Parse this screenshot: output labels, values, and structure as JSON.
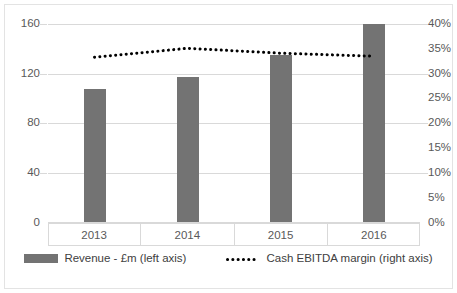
{
  "chart_data": {
    "type": "bar",
    "title": "",
    "subtitle": "",
    "xlabel": "",
    "ylabel": "",
    "categories": [
      "2013",
      "2014",
      "2015",
      "2016"
    ],
    "grid": true,
    "legend_position": "bottom",
    "axes": {
      "left": {
        "label": "Revenue - £m",
        "ylim": [
          0,
          160
        ],
        "ticks": [
          0,
          40,
          80,
          120,
          160
        ],
        "tick_labels": [
          "0",
          "40",
          "80",
          "120",
          "160"
        ]
      },
      "right": {
        "label": "Cash EBITDA margin",
        "ylim": [
          0,
          0.4
        ],
        "ticks": [
          0,
          5,
          10,
          15,
          20,
          25,
          30,
          35,
          40
        ],
        "tick_labels": [
          "0%",
          "5%",
          "10%",
          "15%",
          "20%",
          "25%",
          "30%",
          "35%",
          "40%"
        ]
      }
    },
    "series": [
      {
        "name": "Revenue - £m (left axis)",
        "type": "bar",
        "axis": "left",
        "color": "#737373",
        "values": [
          107.5,
          117,
          135,
          160
        ]
      },
      {
        "name": "Cash EBITDA margin (right axis)",
        "type": "line",
        "style": "dotted",
        "axis": "right",
        "color": "#000000",
        "values": [
          33.3,
          35.1,
          34.1,
          33.5
        ]
      }
    ]
  },
  "legend": {
    "items": [
      {
        "label": "Revenue - £m (left axis)",
        "marker": "bar-swatch",
        "color": "#737373"
      },
      {
        "label": "Cash EBITDA margin (right axis)",
        "marker": "dotted-line-swatch",
        "color": "#000000"
      }
    ]
  },
  "left_axis_labels": [
    "160",
    "120",
    "80",
    "40",
    "0"
  ],
  "right_axis_labels": [
    "40%",
    "35%",
    "30%",
    "25%",
    "20%",
    "15%",
    "10%",
    "5%",
    "0%"
  ],
  "category_labels": [
    "2013",
    "2014",
    "2015",
    "2016"
  ]
}
